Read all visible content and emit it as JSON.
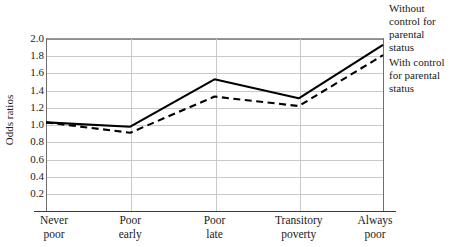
{
  "chart_data": {
    "type": "line",
    "title": "",
    "xlabel": "",
    "ylabel": "Odds ratios",
    "categories": [
      "Never poor",
      "Poor early",
      "Poor late",
      "Transitory poverty",
      "Always poor"
    ],
    "category_lines": [
      [
        "Never",
        "poor"
      ],
      [
        "Poor",
        "early"
      ],
      [
        "Poor",
        "late"
      ],
      [
        "Transitory",
        "poverty"
      ],
      [
        "Always",
        "poor"
      ]
    ],
    "ylim": [
      0,
      2.0
    ],
    "yticks": [
      2.0,
      1.8,
      1.6,
      1.4,
      1.2,
      1.0,
      0.8,
      0.6,
      0.4,
      0.2
    ],
    "ytick_labels": [
      "2.0",
      "1.8",
      "1.6",
      "1.4",
      "1.2",
      "1.0",
      "0.8",
      "0.6",
      "0.4",
      "0.2"
    ],
    "grid": true,
    "legend_position": "right",
    "series": [
      {
        "name": "Without control for parental status",
        "style": "solid",
        "color": "#000000",
        "values": [
          1.02,
          0.97,
          1.52,
          1.3,
          1.92
        ]
      },
      {
        "name": "With control for parental status",
        "style": "dashed",
        "color": "#000000",
        "values": [
          1.02,
          0.9,
          1.32,
          1.21,
          1.8
        ]
      }
    ]
  },
  "legend": {
    "entries": [
      {
        "lines": [
          "Without",
          "control for",
          "parental",
          "status"
        ]
      },
      {
        "lines": [
          "With control",
          "for parental",
          "status"
        ]
      }
    ]
  }
}
